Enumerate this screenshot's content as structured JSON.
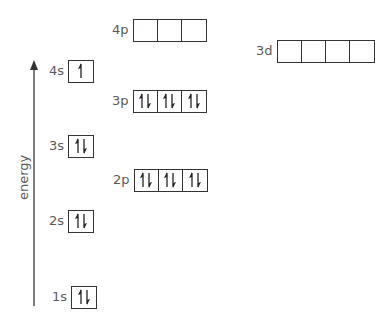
{
  "diagram": {
    "type": "orbital-energy-diagram",
    "axis": {
      "label": "energy",
      "direction": "up"
    },
    "orbitals": [
      {
        "id": "1s",
        "label": "1s",
        "boxes": [
          "updown"
        ],
        "x": 52,
        "y": 285
      },
      {
        "id": "2s",
        "label": "2s",
        "boxes": [
          "updown"
        ],
        "x": 49,
        "y": 209
      },
      {
        "id": "2p",
        "label": "2p",
        "boxes": [
          "updown",
          "updown",
          "updown"
        ],
        "x": 113,
        "y": 168
      },
      {
        "id": "3s",
        "label": "3s",
        "boxes": [
          "updown"
        ],
        "x": 49,
        "y": 134
      },
      {
        "id": "3p",
        "label": "3p",
        "boxes": [
          "updown",
          "updown",
          "updown"
        ],
        "x": 112,
        "y": 89
      },
      {
        "id": "4s",
        "label": "4s",
        "boxes": [
          "up"
        ],
        "x": 49,
        "y": 59
      },
      {
        "id": "4p",
        "label": "4p",
        "boxes": [
          "empty",
          "empty",
          "empty"
        ],
        "x": 112,
        "y": 18
      },
      {
        "id": "3d",
        "label": "3d",
        "boxes": [
          "empty",
          "empty",
          "empty",
          "empty"
        ],
        "x": 256,
        "y": 39
      }
    ],
    "colors": {
      "line": "#333333",
      "text": "#5a5a5a",
      "background": "#ffffff"
    }
  }
}
